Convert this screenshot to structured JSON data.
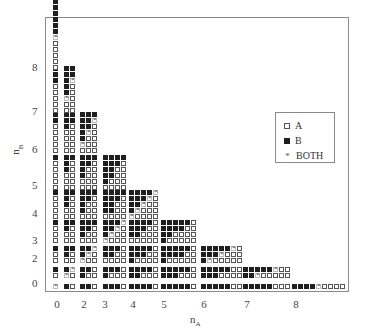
{
  "chart_data": {
    "type": "heatmap",
    "title": "",
    "xlabel": "n_A",
    "ylabel": "n_B",
    "xlabel_main": "n",
    "xlabel_sub": "A",
    "ylabel_main": "n",
    "ylabel_sub": "B",
    "x_ticks": [
      {
        "label": "0",
        "x": 57
      },
      {
        "label": "2",
        "x": 84
      },
      {
        "label": "3",
        "x": 105
      },
      {
        "label": "4",
        "x": 133
      },
      {
        "label": "5",
        "x": 164
      },
      {
        "label": "6",
        "x": 204
      },
      {
        "label": "7",
        "x": 247
      },
      {
        "label": "8",
        "x": 296
      }
    ],
    "y_ticks": [
      {
        "label": "8",
        "y": 67
      },
      {
        "label": "7",
        "y": 111
      },
      {
        "label": "6",
        "y": 149
      },
      {
        "label": "5",
        "y": 185
      },
      {
        "label": "4",
        "y": 213
      },
      {
        "label": "3",
        "y": 240
      },
      {
        "label": "2",
        "y": 258
      },
      {
        "label": "0",
        "y": 283
      }
    ],
    "legend": [
      {
        "key": "A",
        "label": "A",
        "symbol": "open-square"
      },
      {
        "key": "B",
        "label": "B",
        "symbol": "filled-square"
      },
      {
        "key": "S",
        "label": "BOTH",
        "symbol": "asterisk"
      }
    ],
    "cell_encoding": "rows top-to-bottom; columns left-to-right; A=open square, B=filled square, S=asterisk (BOTH)",
    "block_x": {
      "0": 53,
      "1": 64,
      "2": 80,
      "3": 103,
      "4": 129,
      "5": 161,
      "6": 201,
      "7": 243,
      "8": 292
    },
    "block_bottom_y": {
      "0": 289,
      "1": 278,
      "2": 263,
      "3": 243,
      "4": 219,
      "5": 190,
      "6": 153,
      "7": 113,
      "8": 70
    },
    "blocks": [
      {
        "nA": 0,
        "nB": 0,
        "rows": [
          "S"
        ]
      },
      {
        "nA": 1,
        "nB": 0,
        "rows": [
          "BA"
        ]
      },
      {
        "nA": 2,
        "nB": 0,
        "rows": [
          "BBA"
        ]
      },
      {
        "nA": 3,
        "nB": 0,
        "rows": [
          "BBBA"
        ]
      },
      {
        "nA": 4,
        "nB": 0,
        "rows": [
          "BBBBA"
        ]
      },
      {
        "nA": 5,
        "nB": 0,
        "rows": [
          "BBBBBA"
        ]
      },
      {
        "nA": 6,
        "nB": 0,
        "rows": [
          "BBBBBAA"
        ]
      },
      {
        "nA": 7,
        "nB": 0,
        "rows": [
          "BBBBBAAA"
        ]
      },
      {
        "nA": 8,
        "nB": 0,
        "rows": [
          "BBBBSAAAA"
        ]
      },
      {
        "nA": 0,
        "nB": 1,
        "rows": [
          "B",
          "A"
        ]
      },
      {
        "nA": 1,
        "nB": 1,
        "rows": [
          "BS",
          "SA"
        ]
      },
      {
        "nA": 2,
        "nB": 1,
        "rows": [
          "BBA",
          "BAA"
        ]
      },
      {
        "nA": 3,
        "nB": 1,
        "rows": [
          "BBBA",
          "BAAA"
        ]
      },
      {
        "nA": 4,
        "nB": 1,
        "rows": [
          "BBBBA",
          "BBAAA"
        ]
      },
      {
        "nA": 5,
        "nB": 1,
        "rows": [
          "BBBBBA",
          "BBBAAA"
        ]
      },
      {
        "nA": 6,
        "nB": 1,
        "rows": [
          "BBBBBAA",
          "BBBAAAA"
        ]
      },
      {
        "nA": 7,
        "nB": 1,
        "rows": [
          "BBBBBSAA",
          "BBSAAAAA"
        ]
      },
      {
        "nA": 0,
        "nB": 2,
        "rows": [
          "B",
          "A",
          "A"
        ]
      },
      {
        "nA": 1,
        "nB": 2,
        "rows": [
          "BB",
          "BA",
          "AA"
        ]
      },
      {
        "nA": 2,
        "nB": 2,
        "rows": [
          "BBS",
          "BSA",
          "SAA"
        ]
      },
      {
        "nA": 3,
        "nB": 2,
        "rows": [
          "BBBA",
          "BBAA",
          "AAAA"
        ]
      },
      {
        "nA": 4,
        "nB": 2,
        "rows": [
          "BBBBA",
          "BBBAA",
          "BAAAA"
        ]
      },
      {
        "nA": 5,
        "nB": 2,
        "rows": [
          "BBBBBA",
          "BBBBAA",
          "BAAAAA"
        ]
      },
      {
        "nA": 6,
        "nB": 2,
        "rows": [
          "BBBBBSA",
          "BBBSAAA",
          "BSAAAAA"
        ]
      },
      {
        "nA": 0,
        "nB": 3,
        "rows": [
          "B",
          "A",
          "A",
          "A"
        ]
      },
      {
        "nA": 1,
        "nB": 3,
        "rows": [
          "BB",
          "BA",
          "AA",
          "AA"
        ]
      },
      {
        "nA": 2,
        "nB": 3,
        "rows": [
          "BBB",
          "BBA",
          "BAA",
          "AAA"
        ]
      },
      {
        "nA": 3,
        "nB": 3,
        "rows": [
          "BBBS",
          "BBSA",
          "BSAA",
          "SAAA"
        ]
      },
      {
        "nA": 4,
        "nB": 3,
        "rows": [
          "BBBBA",
          "BBBAA",
          "BBAAA",
          "AAAAA"
        ]
      },
      {
        "nA": 5,
        "nB": 3,
        "rows": [
          "BBBBBA",
          "BBBBAA",
          "BBAAAA",
          "BAAAAA"
        ]
      },
      {
        "nA": 0,
        "nB": 4,
        "rows": [
          "B",
          "A",
          "A",
          "A",
          "A"
        ]
      },
      {
        "nA": 1,
        "nB": 4,
        "rows": [
          "BB",
          "BA",
          "BA",
          "AA",
          "AA"
        ]
      },
      {
        "nA": 2,
        "nB": 4,
        "rows": [
          "BBB",
          "BBA",
          "BAA",
          "BAA",
          "AAA"
        ]
      },
      {
        "nA": 3,
        "nB": 4,
        "rows": [
          "BBBB",
          "BBBA",
          "BBAA",
          "BBAA",
          "AAAA"
        ]
      },
      {
        "nA": 4,
        "nB": 4,
        "rows": [
          "BBBBS",
          "BBBSA",
          "BBSAA",
          "BSAAA",
          "SAAAA"
        ]
      },
      {
        "nA": 0,
        "nB": 5,
        "rows": [
          "B",
          "A",
          "A",
          "A",
          "A",
          "A"
        ]
      },
      {
        "nA": 1,
        "nB": 5,
        "rows": [
          "BB",
          "BA",
          "BA",
          "AA",
          "AA",
          "AA"
        ]
      },
      {
        "nA": 2,
        "nB": 5,
        "rows": [
          "BBB",
          "BBA",
          "BAA",
          "BAA",
          "AAA",
          "AAA"
        ]
      },
      {
        "nA": 3,
        "nB": 5,
        "rows": [
          "BBBB",
          "BBBA",
          "BBAA",
          "BBAA",
          "BAAA",
          "AAAA"
        ]
      },
      {
        "nA": 0,
        "nB": 6,
        "rows": [
          "B",
          "B",
          "A",
          "A",
          "A",
          "A",
          "A"
        ]
      },
      {
        "nA": 1,
        "nB": 6,
        "rows": [
          "BB",
          "BB",
          "BA",
          "AA",
          "AA",
          "AA",
          "AA"
        ]
      },
      {
        "nA": 2,
        "nB": 6,
        "rows": [
          "BBB",
          "BBS",
          "BBA",
          "BSA",
          "BAA",
          "SAA",
          "AAA"
        ]
      },
      {
        "nA": 0,
        "nB": 7,
        "rows": [
          "B",
          "B",
          "B",
          "A",
          "A",
          "A",
          "A",
          "A"
        ]
      },
      {
        "nA": 1,
        "nB": 7,
        "rows": [
          "BB",
          "BB",
          "BS",
          "BA",
          "BA",
          "SA",
          "AA",
          "AA"
        ]
      },
      {
        "nA": 0,
        "nB": 8,
        "rows": [
          "B",
          "B",
          "B",
          "B",
          "B",
          "B",
          "S",
          "A",
          "A",
          "A",
          "A",
          "A"
        ]
      }
    ]
  }
}
